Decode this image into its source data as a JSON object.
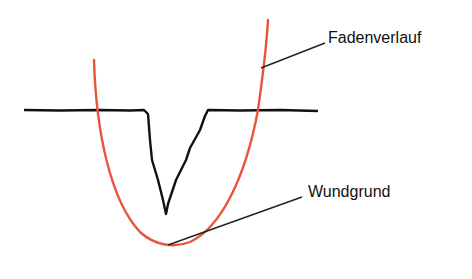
{
  "diagram": {
    "labels": {
      "thread": "Fadenverlauf",
      "wound_base": "Wundgrund"
    },
    "colors": {
      "thread": "#e8553a",
      "wound": "#111111",
      "leader": "#222222"
    }
  }
}
